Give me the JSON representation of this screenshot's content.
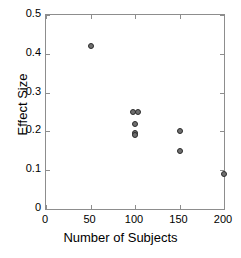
{
  "chart_data": {
    "type": "scatter",
    "title": "",
    "xlabel": "Number of Subjects",
    "ylabel": "Effect Size",
    "xlim": [
      0,
      200
    ],
    "ylim": [
      0,
      0.5
    ],
    "xticks": [
      "0",
      "50",
      "100",
      "150",
      "200"
    ],
    "xtick_values": [
      0,
      50,
      100,
      150,
      200
    ],
    "yticks": [
      "0",
      "0.1",
      "0.2",
      "0.3",
      "0.4",
      "0.5"
    ],
    "ytick_values": [
      0,
      0.1,
      0.2,
      0.3,
      0.4,
      0.5
    ],
    "grid": false,
    "legend": null,
    "marker_style": "open circle, dark gray fill, black outline",
    "points": [
      {
        "x": 50,
        "y": 0.42
      },
      {
        "x": 98,
        "y": 0.25
      },
      {
        "x": 103,
        "y": 0.25
      },
      {
        "x": 100,
        "y": 0.22
      },
      {
        "x": 100,
        "y": 0.195
      },
      {
        "x": 100,
        "y": 0.19
      },
      {
        "x": 150,
        "y": 0.2
      },
      {
        "x": 150,
        "y": 0.15
      },
      {
        "x": 200,
        "y": 0.09
      }
    ]
  },
  "colors": {
    "axis": "#8d8d8d",
    "marker_fill": "#6f6f6f",
    "marker_edge": "#2b2b2b",
    "text": "#000000",
    "background": "#ffffff"
  }
}
